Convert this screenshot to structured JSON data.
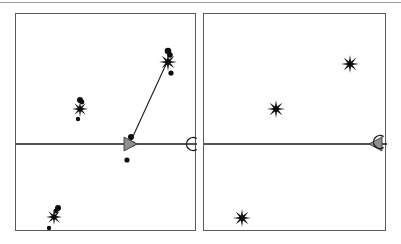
{
  "figure": {
    "title": "",
    "background_color": "#ffffff",
    "top_rule_color": "#9a9a9a",
    "panel_border_color": "#5b5b5b",
    "marker_color": "#0d0d0d",
    "wedge_fill_color": "#8f8f8f"
  },
  "chart_data": {
    "type": "scatter",
    "title": "",
    "subtitle": "",
    "xlabel": "",
    "ylabel": "",
    "grid": false,
    "legend": null,
    "panel_count": 2,
    "panels": [
      {
        "name": "left-panel",
        "label": "",
        "xlim": [
          0,
          181
        ],
        "ylim": [
          0,
          218
        ],
        "axis_line": {
          "x1": 0,
          "y1": 130,
          "x2": 181,
          "y2": 130
        },
        "trajectory_line": {
          "x1": 113,
          "y1": 131,
          "x2": 152,
          "y2": 46
        },
        "wedge": {
          "x": 108,
          "y": 130,
          "angle_deg": 0,
          "direction": "right"
        },
        "arc_marker": {
          "x": 177,
          "y": 130,
          "shape": "C"
        },
        "series": [
          {
            "name": "star-markers",
            "marker": "star8",
            "points": [
              {
                "x": 152,
                "y": 48,
                "size": 9
              },
              {
                "x": 64,
                "y": 95,
                "size": 8
              },
              {
                "x": 38,
                "y": 203,
                "size": 8
              }
            ]
          },
          {
            "name": "dot-markers",
            "marker": "circle",
            "points": [
              {
                "x": 152,
                "y": 37,
                "size": 3.3
              },
              {
                "x": 154,
                "y": 41,
                "size": 2.8
              },
              {
                "x": 155,
                "y": 59,
                "size": 2.6
              },
              {
                "x": 64,
                "y": 86,
                "size": 3.0
              },
              {
                "x": 66,
                "y": 88,
                "size": 2.4
              },
              {
                "x": 62,
                "y": 105,
                "size": 2.2
              },
              {
                "x": 115,
                "y": 123,
                "size": 3.0
              },
              {
                "x": 117,
                "y": 130,
                "size": 2.4
              },
              {
                "x": 113,
                "y": 131,
                "size": 2.2
              },
              {
                "x": 111,
                "y": 146,
                "size": 2.6
              },
              {
                "x": 42,
                "y": 194,
                "size": 3.0
              },
              {
                "x": 40,
                "y": 197,
                "size": 2.4
              },
              {
                "x": 33,
                "y": 214,
                "size": 2.2
              }
            ]
          }
        ]
      },
      {
        "name": "right-panel",
        "label": "",
        "xlim": [
          0,
          183
        ],
        "ylim": [
          0,
          218
        ],
        "axis_line": {
          "x1": 0,
          "y1": 130,
          "x2": 183,
          "y2": 130
        },
        "trajectory_line": null,
        "wedge": {
          "x": 178,
          "y": 130,
          "angle_deg": 180,
          "direction": "left"
        },
        "arc_marker": {
          "x": 176,
          "y": 128,
          "shape": "C"
        },
        "series": [
          {
            "name": "star-markers",
            "marker": "star8",
            "points": [
              {
                "x": 146,
                "y": 50,
                "size": 9
              },
              {
                "x": 72,
                "y": 95,
                "size": 9
              },
              {
                "x": 38,
                "y": 204,
                "size": 9
              }
            ]
          },
          {
            "name": "dot-markers",
            "marker": "circle",
            "points": []
          }
        ]
      }
    ]
  }
}
